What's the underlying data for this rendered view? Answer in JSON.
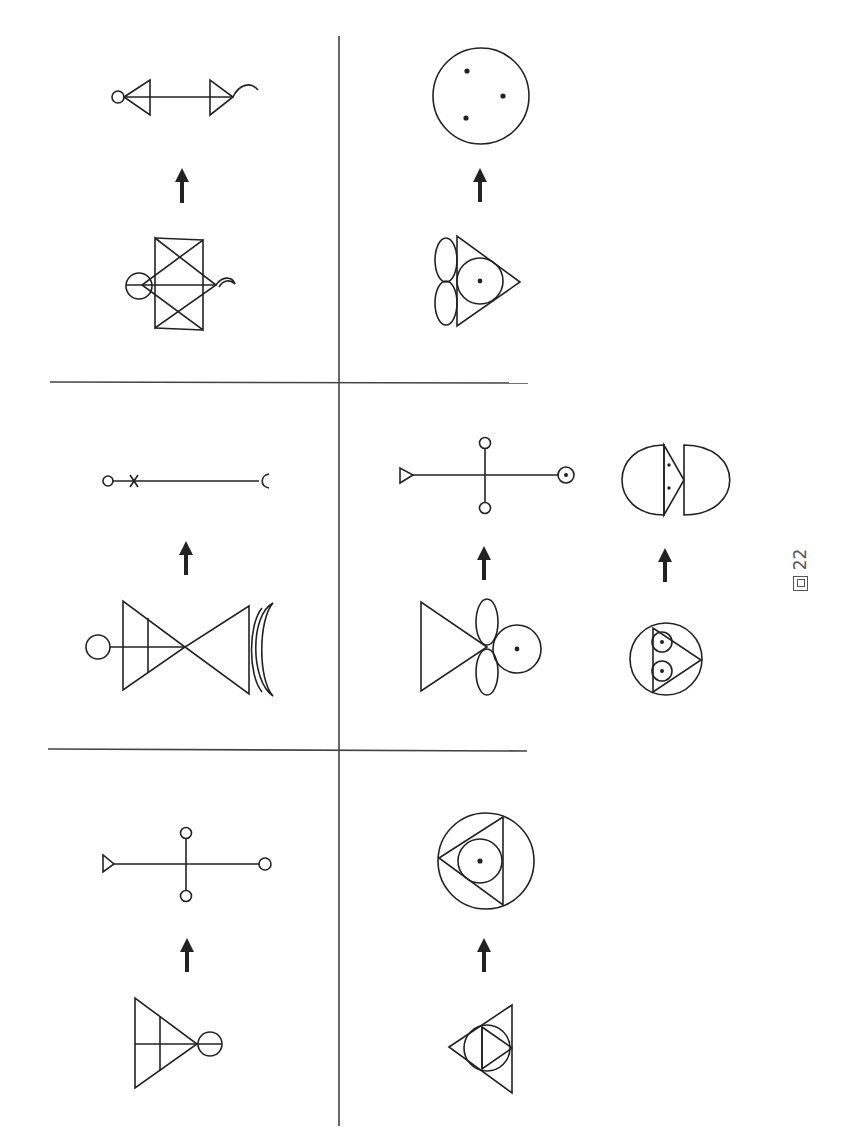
{
  "figure": {
    "caption_prefix": "圖",
    "caption_number": "22",
    "caption": "圖 22",
    "orientation": "rotated 90° counter-clockwise",
    "stroke_color": "#222222",
    "divider_color": "#444444",
    "background": "#ffffff"
  },
  "layout": {
    "grid": "3 rows × 2 columns of panels separated by divider lines",
    "dividers": {
      "vertical_x": 339,
      "horizontal_y": [
        382,
        750
      ]
    }
  },
  "panels": [
    {
      "id": "top-left",
      "source_figure": "two overlapping triangles (hexagram-like) with circle on left and small crescent hook on right, horizontal axis line",
      "arrow": "upward arrow",
      "result_figure": "horizontal line with small circle on left, two triangles, and hook curve on right"
    },
    {
      "id": "top-right",
      "source_figure": "triangle with inscribed circle containing a dot, two stacked ellipses on the left",
      "arrow": "upward arrow",
      "result_figure": "large circle containing three dots"
    },
    {
      "id": "middle-left",
      "source_figure": "two opposing triangles (bowtie) with circle and cross line on left, double crescent on right",
      "arrow": "upward arrow",
      "result_figure": "horizontal line with small circle and x mark on left, open hook on right"
    },
    {
      "id": "middle-right",
      "source_figure": "triangle with two stacked ellipses and a circle containing a dot",
      "arrow": "upward arrow",
      "result_figure": "cross with small triangle on left end, dotted circle on right end, small circles at top and bottom"
    },
    {
      "id": "middle-extra",
      "source_figure": "circle containing triangle with two stacked small circles with dots",
      "arrow": "upward arrow",
      "result_figure": "two half-ellipses facing apart with a triangle containing two dots between them"
    },
    {
      "id": "bottom-left",
      "source_figure": "triangle with vertical and horizontal internal lines and circle at apex",
      "arrow": "upward arrow",
      "result_figure": "cross with small triangle on left end, small circles at right, top and bottom ends"
    },
    {
      "id": "bottom-right",
      "source_figure": "triangle containing circle and inner triangle",
      "arrow": "upward arrow",
      "result_figure": "circle containing triangle with inscribed circle with central dot"
    }
  ]
}
